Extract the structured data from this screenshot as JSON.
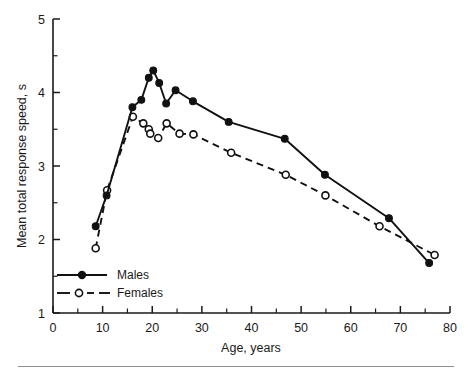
{
  "chart_data": {
    "type": "line",
    "title": "",
    "xlabel": "Age, years",
    "ylabel": "Mean total response speed, s",
    "xlim": [
      0,
      80
    ],
    "ylim": [
      1,
      5
    ],
    "xticks": [
      0,
      10,
      20,
      30,
      40,
      50,
      60,
      70,
      80
    ],
    "xtick_labels": [
      "0",
      "10",
      "20",
      "30",
      "40",
      "50",
      "60",
      "70",
      "80"
    ],
    "xminor_step": 5,
    "yticks": [
      1,
      2,
      3,
      4,
      5
    ],
    "ytick_labels": [
      "1",
      "2",
      "3",
      "4",
      "5"
    ],
    "yminor_step": 0.5,
    "grid": false,
    "legend_position": "lower-left",
    "series": [
      {
        "name": "Males",
        "marker": "filled-circle",
        "linestyle": "solid",
        "color": "#111111",
        "points": [
          [
            8.6,
            2.18
          ],
          [
            10.8,
            2.6
          ],
          [
            16.0,
            3.8
          ],
          [
            17.8,
            3.9
          ],
          [
            19.3,
            4.2
          ],
          [
            20.2,
            4.3
          ],
          [
            21.4,
            4.13
          ],
          [
            22.8,
            3.85
          ],
          [
            24.7,
            4.03
          ],
          [
            28.2,
            3.88
          ],
          [
            35.4,
            3.6
          ],
          [
            46.7,
            3.37
          ],
          [
            54.8,
            2.88
          ],
          [
            67.7,
            2.29
          ],
          [
            75.8,
            1.68
          ]
        ]
      },
      {
        "name": "Females",
        "marker": "open-circle",
        "linestyle": "dashed",
        "color": "#111111",
        "points": [
          [
            8.6,
            1.88
          ],
          [
            10.9,
            2.67
          ],
          [
            16.1,
            3.67
          ],
          [
            18.2,
            3.58
          ],
          [
            19.3,
            3.5
          ],
          [
            19.6,
            3.44
          ],
          [
            21.2,
            3.38
          ],
          [
            22.9,
            3.58
          ],
          [
            25.5,
            3.44
          ],
          [
            28.3,
            3.43
          ],
          [
            35.9,
            3.18
          ],
          [
            46.9,
            2.88
          ],
          [
            54.9,
            2.6
          ],
          [
            65.8,
            2.18
          ],
          [
            76.9,
            1.79
          ]
        ]
      }
    ]
  },
  "legend": {
    "entries": [
      {
        "label": "Males"
      },
      {
        "label": "Females"
      }
    ]
  },
  "axes": {
    "x_title": "Age, years",
    "y_title": "Mean total response speed, s"
  }
}
